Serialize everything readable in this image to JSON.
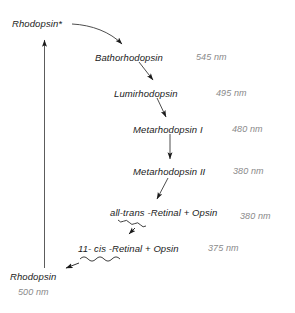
{
  "diagram": {
    "colors": {
      "text": "#1a1a1a",
      "wavelength": "#8a8a8a",
      "arrow": "#1a1a1a",
      "background": "#ffffff"
    },
    "nodes": [
      {
        "id": "rhodopsin-excited",
        "label": "Rhodopsin*",
        "x": 12,
        "y": 18,
        "wavelength": null
      },
      {
        "id": "bathorhodopsin",
        "label": "Bathorhodopsin",
        "x": 95,
        "y": 52,
        "wavelength": "545 nm",
        "wx": 196,
        "wy": 52
      },
      {
        "id": "lumirhodopsin",
        "label": "Lumirhodopsin",
        "x": 114,
        "y": 88,
        "wavelength": "495 nm",
        "wx": 216,
        "wy": 88
      },
      {
        "id": "metarhodopsin-i",
        "label": "Metarhodopsin I",
        "x": 133,
        "y": 124,
        "wavelength": "480 nm",
        "wx": 232,
        "wy": 124
      },
      {
        "id": "metarhodopsin-ii",
        "label": "Metarhodopsin II",
        "x": 133,
        "y": 166,
        "wavelength": "380 nm",
        "wx": 233,
        "wy": 166
      },
      {
        "id": "all-trans-retinal-opsin",
        "label": "all-trans -Retinal + Opsin",
        "x": 110,
        "y": 207,
        "wavelength": "380 nm",
        "wx": 240,
        "wy": 211
      },
      {
        "id": "eleven-cis-retinal-opsin",
        "label": "11- cis -Retinal + Opsin",
        "x": 78,
        "y": 243,
        "wavelength": "375 nm",
        "wx": 208,
        "wy": 243
      },
      {
        "id": "rhodopsin",
        "label": "Rhodopsin",
        "x": 10,
        "y": 271,
        "wavelength": "500 nm",
        "wx": 18,
        "wy": 287
      }
    ],
    "edges": [
      {
        "id": "edge-rhodopsin-excited-to-bathorhodopsin",
        "style": "curved",
        "from": "rhodopsin-excited",
        "to": "bathorhodopsin"
      },
      {
        "id": "edge-bathorhodopsin-to-lumirhodopsin",
        "style": "straight",
        "from": "bathorhodopsin",
        "to": "lumirhodopsin"
      },
      {
        "id": "edge-lumirhodopsin-to-metarhodopsin-i",
        "style": "straight",
        "from": "lumirhodopsin",
        "to": "metarhodopsin-i"
      },
      {
        "id": "edge-metarhodopsin-i-to-metarhodopsin-ii",
        "style": "straight-vertical",
        "from": "metarhodopsin-i",
        "to": "metarhodopsin-ii"
      },
      {
        "id": "edge-metarhodopsin-ii-to-all-trans",
        "style": "straight",
        "from": "metarhodopsin-ii",
        "to": "all-trans-retinal-opsin"
      },
      {
        "id": "edge-all-trans-to-eleven-cis",
        "style": "wavy",
        "from": "all-trans-retinal-opsin",
        "to": "eleven-cis-retinal-opsin"
      },
      {
        "id": "edge-eleven-cis-to-rhodopsin",
        "style": "wavy",
        "from": "eleven-cis-retinal-opsin",
        "to": "rhodopsin"
      },
      {
        "id": "edge-rhodopsin-to-rhodopsin-excited",
        "style": "long-vertical",
        "from": "rhodopsin",
        "to": "rhodopsin-excited"
      }
    ]
  }
}
